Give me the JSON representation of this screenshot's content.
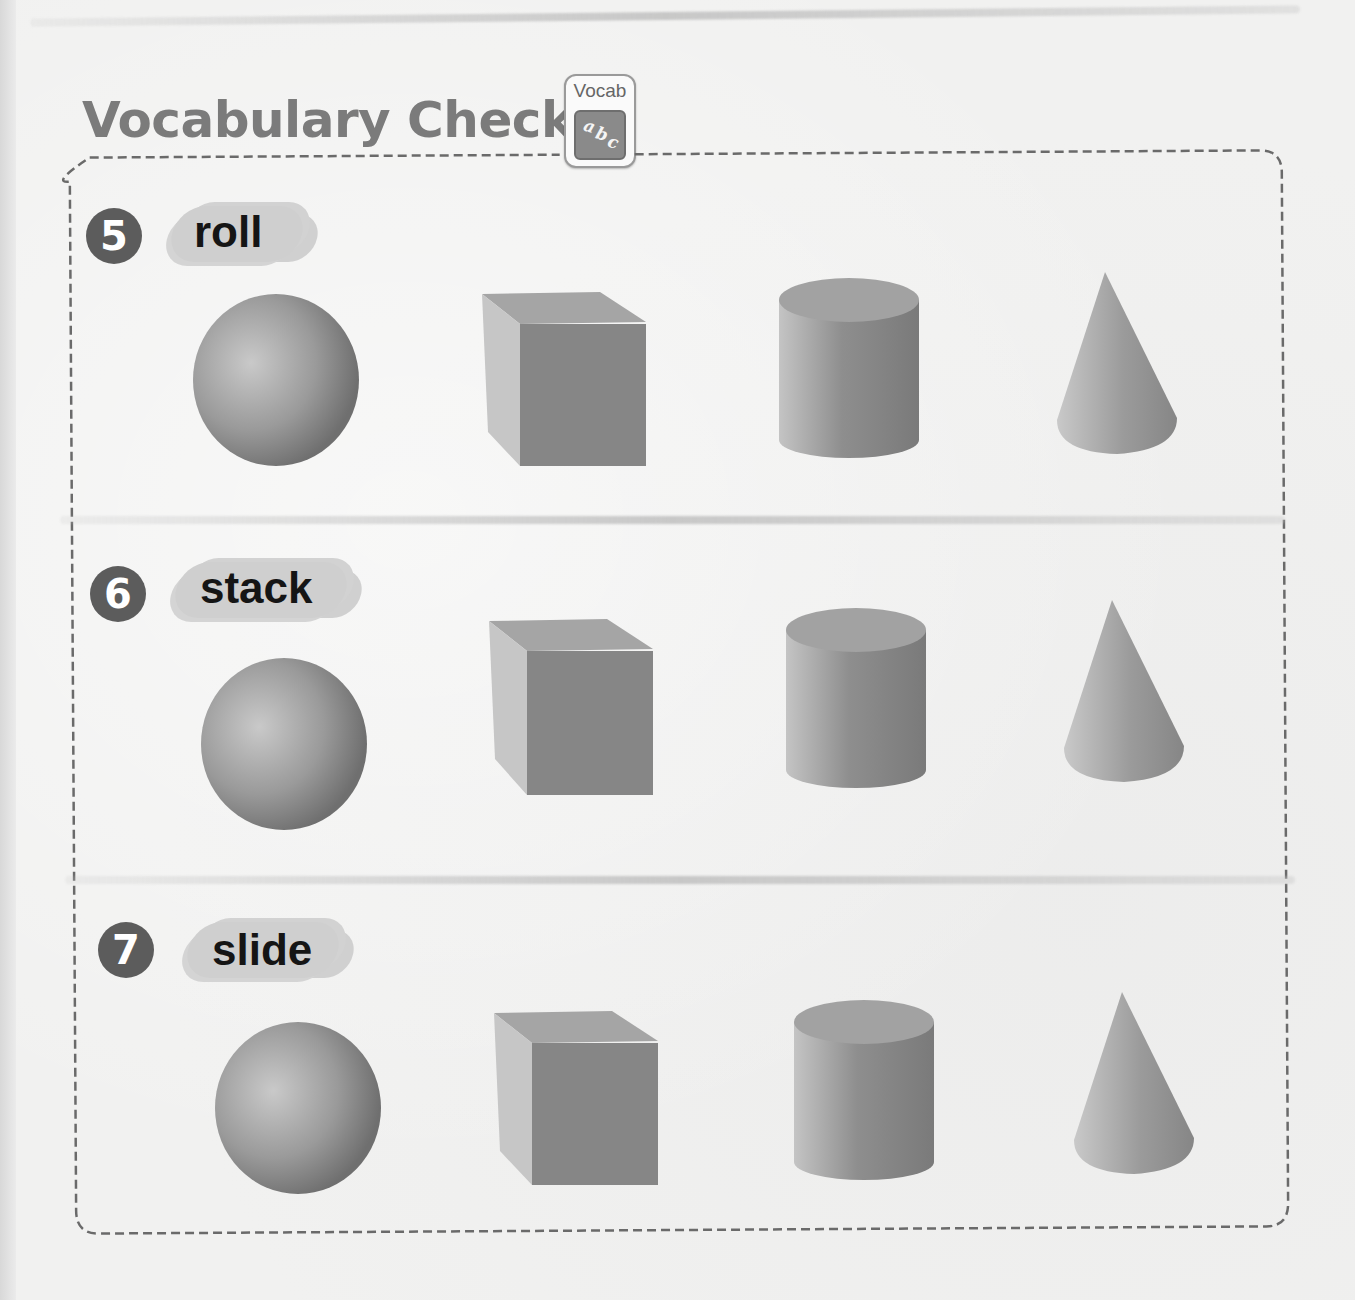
{
  "header": {
    "title": "Vocabulary Check",
    "badge": {
      "label": "Vocab",
      "icon_letters": [
        "a",
        "b",
        "c"
      ],
      "icon": "abc-vocab-icon"
    }
  },
  "items": [
    {
      "number": "5",
      "word": "roll",
      "shapes": [
        "sphere",
        "cube",
        "cylinder",
        "cone"
      ]
    },
    {
      "number": "6",
      "word": "stack",
      "shapes": [
        "sphere",
        "cube",
        "cylinder",
        "cone"
      ]
    },
    {
      "number": "7",
      "word": "slide",
      "shapes": [
        "sphere",
        "cube",
        "cylinder",
        "cone"
      ]
    }
  ],
  "colors": {
    "title": "#7b7b7b",
    "number_circle": "#5c5c5c",
    "word_highlight": "#cfcfcf",
    "dashed_border": "#6a6a6a",
    "shape_light": "#c4c4c4",
    "shape_dark": "#7e7e7e"
  }
}
